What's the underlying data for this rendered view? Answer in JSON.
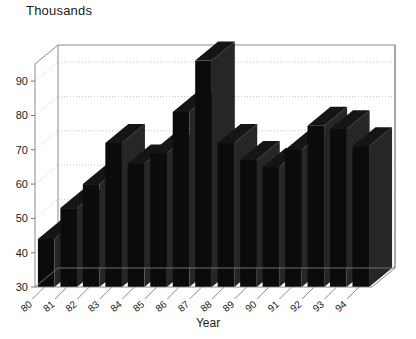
{
  "chart_data": {
    "type": "bar",
    "title": "Thousands",
    "subtitle": "",
    "xlabel": "Year",
    "ylabel": "",
    "categories": [
      "80",
      "81",
      "82",
      "83",
      "84",
      "85",
      "86",
      "87",
      "88",
      "89",
      "90",
      "91",
      "92",
      "93",
      "94"
    ],
    "values": [
      44,
      53,
      60,
      72,
      66,
      69,
      81,
      96,
      72,
      67,
      65,
      70,
      77,
      76,
      71
    ],
    "ylim": [
      30,
      95
    ],
    "yticks": [
      30,
      40,
      50,
      60,
      70,
      80,
      90
    ],
    "ytick_labels": [
      "30",
      "40",
      "50",
      "60",
      "70",
      "80",
      "90"
    ],
    "grid": true,
    "legend": false,
    "legend_position": "none",
    "style": "3d-column",
    "bar_color": "#0b0b0b",
    "bar_side_color": "#262626",
    "grid_color": "#b5b5b5",
    "axis_color": "#8a8a8a"
  },
  "axes": {
    "x_title": "Year",
    "y_title": "Thousands"
  }
}
